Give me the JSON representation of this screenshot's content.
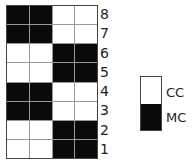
{
  "chart": {
    "columns": 4,
    "rows": [
      {
        "label": "8",
        "cells": [
          "MC",
          "MC",
          "CC",
          "CC"
        ]
      },
      {
        "label": "7",
        "cells": [
          "MC",
          "MC",
          "CC",
          "CC"
        ]
      },
      {
        "label": "6",
        "cells": [
          "CC",
          "CC",
          "MC",
          "MC"
        ]
      },
      {
        "label": "5",
        "cells": [
          "CC",
          "CC",
          "MC",
          "MC"
        ]
      },
      {
        "label": "4",
        "cells": [
          "MC",
          "MC",
          "CC",
          "CC"
        ]
      },
      {
        "label": "3",
        "cells": [
          "MC",
          "MC",
          "CC",
          "CC"
        ]
      },
      {
        "label": "2",
        "cells": [
          "CC",
          "CC",
          "MC",
          "MC"
        ]
      },
      {
        "label": "1",
        "cells": [
          "CC",
          "CC",
          "MC",
          "MC"
        ]
      }
    ]
  },
  "legend": {
    "items": [
      {
        "key": "CC",
        "label": "CC",
        "color": "#ffffff"
      },
      {
        "key": "MC",
        "label": "MC",
        "color": "#0a0a0a"
      }
    ]
  }
}
